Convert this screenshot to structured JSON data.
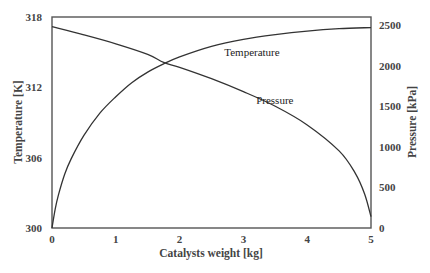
{
  "chart_data": {
    "type": "line",
    "title": "",
    "xlabel": "Catalysts weight [kg]",
    "ylabel_left": "Temperature [K]",
    "ylabel_right": "Pressure [kPa]",
    "xlim": [
      0,
      5
    ],
    "ylim_left": [
      300,
      318
    ],
    "ylim_right": [
      0,
      2600
    ],
    "x_ticks": [
      "0",
      "1",
      "2",
      "3",
      "4",
      "5"
    ],
    "y_left_ticks": [
      "300",
      "306",
      "312",
      "318"
    ],
    "y_right_ticks": [
      "0",
      "500",
      "1000",
      "1500",
      "2000",
      "2500"
    ],
    "grid": false,
    "legend": "none (inline curve annotations)",
    "series": [
      {
        "name": "Temperature",
        "axis": "left",
        "x": [
          0,
          0.05,
          0.1,
          0.2,
          0.3,
          0.5,
          0.75,
          1.0,
          1.25,
          1.5,
          1.75,
          2.0,
          2.5,
          3.0,
          3.5,
          4.0,
          4.5,
          5.0
        ],
        "values": [
          300.0,
          301.6,
          302.8,
          304.6,
          305.9,
          307.9,
          309.8,
          311.2,
          312.4,
          313.3,
          314.0,
          314.6,
          315.5,
          316.1,
          316.5,
          316.8,
          317.0,
          317.1
        ]
      },
      {
        "name": "Pressure",
        "axis": "right",
        "x": [
          0,
          0.5,
          1.0,
          1.5,
          1.75,
          2.0,
          2.5,
          3.0,
          3.5,
          4.0,
          4.5,
          4.75,
          4.9,
          5.0
        ],
        "values": [
          2480,
          2380,
          2270,
          2140,
          2040,
          1980,
          1840,
          1680,
          1500,
          1270,
          950,
          680,
          420,
          140
        ]
      }
    ],
    "annotations": [
      {
        "text": "Temperature",
        "x": 2.7,
        "y_left": 314.7
      },
      {
        "text": "Pressure",
        "x": 3.2,
        "y_left": 310.6
      }
    ]
  }
}
